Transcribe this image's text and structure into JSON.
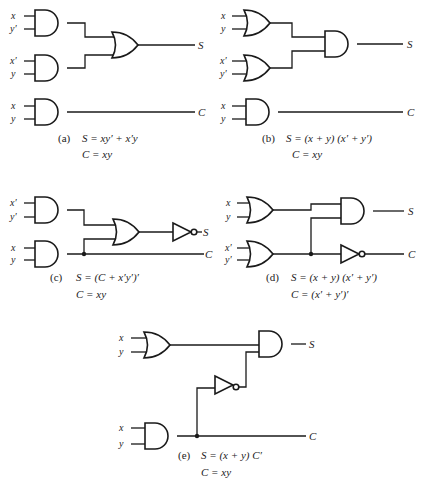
{
  "figure": {
    "panels": [
      {
        "id": "a",
        "tag": "(a)",
        "inputs": [
          "x",
          "y′",
          "x′",
          "y",
          "x",
          "y"
        ],
        "outputs": [
          "S",
          "C"
        ],
        "equation_s": "S = xy′ + x′y",
        "equation_c": "C = xy",
        "gates": [
          "AND",
          "AND",
          "OR",
          "AND"
        ]
      },
      {
        "id": "b",
        "tag": "(b)",
        "inputs": [
          "x",
          "y",
          "x′",
          "y′",
          "x",
          "y"
        ],
        "outputs": [
          "S",
          "C"
        ],
        "equation_s": "S = (x + y) (x′ + y′)",
        "equation_c": "C = xy",
        "gates": [
          "OR",
          "OR",
          "AND",
          "AND"
        ]
      },
      {
        "id": "c",
        "tag": "(c)",
        "inputs": [
          "x′",
          "y′",
          "x",
          "y"
        ],
        "outputs": [
          "S",
          "C"
        ],
        "equation_s": "S = (C + x′y′)′",
        "equation_c": "C = xy",
        "gates": [
          "AND",
          "AND",
          "OR",
          "NOT"
        ]
      },
      {
        "id": "d",
        "tag": "(d)",
        "inputs": [
          "x",
          "y",
          "x′",
          "y′"
        ],
        "outputs": [
          "S",
          "C"
        ],
        "equation_s": "S = (x + y) (x′ + y′)",
        "equation_c": "C = (x′ + y′)′",
        "gates": [
          "OR",
          "OR",
          "AND",
          "NOT"
        ]
      },
      {
        "id": "e",
        "tag": "(e)",
        "inputs": [
          "x",
          "y",
          "x",
          "y"
        ],
        "outputs": [
          "S",
          "C"
        ],
        "equation_s": "S = (x + y) C′",
        "equation_c": "C = xy",
        "gates": [
          "OR",
          "AND",
          "NOT",
          "AND"
        ]
      }
    ]
  }
}
